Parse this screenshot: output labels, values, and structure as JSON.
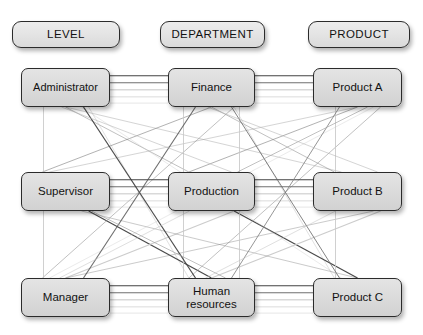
{
  "diagram": {
    "title_row": [
      {
        "id": "level",
        "label": "LEVEL"
      },
      {
        "id": "department",
        "label": "DEPARTMENT"
      },
      {
        "id": "product",
        "label": "PRODUCT"
      }
    ],
    "columns": [
      {
        "id": "level",
        "header": "LEVEL",
        "nodes": [
          {
            "id": "administrator",
            "label": "Administrator"
          },
          {
            "id": "supervisor",
            "label": "Supervisor"
          },
          {
            "id": "manager",
            "label": "Manager"
          }
        ]
      },
      {
        "id": "department",
        "header": "DEPARTMENT",
        "nodes": [
          {
            "id": "finance",
            "label": "Finance"
          },
          {
            "id": "production",
            "label": "Production"
          },
          {
            "id": "human-resources",
            "label": "Human resources"
          }
        ]
      },
      {
        "id": "product",
        "header": "PRODUCT",
        "nodes": [
          {
            "id": "product-a",
            "label": "Product A"
          },
          {
            "id": "product-b",
            "label": "Product B"
          },
          {
            "id": "product-c",
            "label": "Product C"
          }
        ]
      }
    ],
    "colors": {
      "node_fill": "#dcdcdc",
      "node_border": "#2b2b2b",
      "text": "#121212",
      "edge_dark": "#3a3a3a",
      "edge_mid": "#8a8a8a",
      "edge_light": "#c8c8c8",
      "background": "#ffffff"
    },
    "geometry": {
      "header_y": 21,
      "header_h": 27,
      "row_y": [
        68,
        172,
        278
      ],
      "row_h": 39,
      "col_x": [
        21,
        168,
        313
      ],
      "col_w": [
        89,
        87,
        89
      ]
    },
    "edge_note": "fully connected tripartite mesh between LEVEL, DEPARTMENT and PRODUCT nodes"
  }
}
